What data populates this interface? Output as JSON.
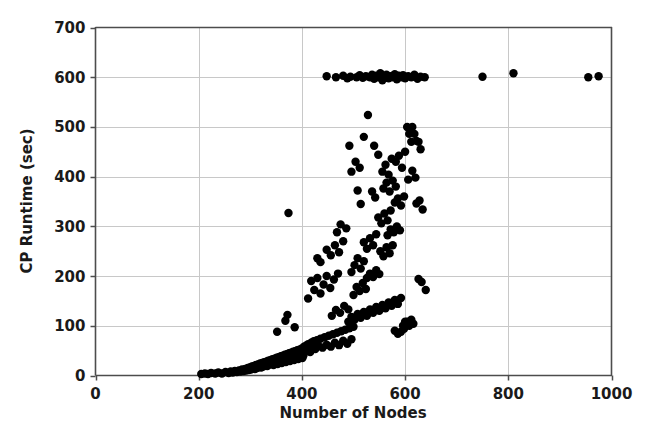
{
  "chart_data": {
    "type": "scatter",
    "title": "",
    "xlabel": "Number of Nodes",
    "ylabel": "CP Runtime (sec)",
    "xlim": [
      0,
      1000
    ],
    "ylim": [
      0,
      700
    ],
    "xticks": [
      0,
      200,
      400,
      600,
      800,
      1000
    ],
    "yticks": [
      0,
      100,
      200,
      300,
      400,
      500,
      600,
      700
    ],
    "xtick_labels": [
      "0",
      "200",
      "400",
      "600",
      "800",
      "1000"
    ],
    "ytick_labels": [
      "0",
      "100",
      "200",
      "300",
      "400",
      "500",
      "600",
      "700"
    ],
    "grid": true,
    "grid_color": "#c8c8c8",
    "marker_color": "#000000",
    "marker_size": 4.2,
    "legend": null,
    "points": [
      [
        205,
        3
      ],
      [
        212,
        4
      ],
      [
        218,
        3
      ],
      [
        224,
        5
      ],
      [
        232,
        4
      ],
      [
        238,
        6
      ],
      [
        245,
        4
      ],
      [
        252,
        7
      ],
      [
        258,
        5
      ],
      [
        262,
        8
      ],
      [
        266,
        6
      ],
      [
        270,
        9
      ],
      [
        274,
        7
      ],
      [
        278,
        10
      ],
      [
        281,
        8
      ],
      [
        284,
        12
      ],
      [
        287,
        9
      ],
      [
        290,
        13
      ],
      [
        292,
        10
      ],
      [
        295,
        15
      ],
      [
        297,
        11
      ],
      [
        299,
        16
      ],
      [
        301,
        12
      ],
      [
        303,
        18
      ],
      [
        305,
        14
      ],
      [
        307,
        19
      ],
      [
        309,
        13
      ],
      [
        311,
        21
      ],
      [
        313,
        15
      ],
      [
        315,
        22
      ],
      [
        317,
        17
      ],
      [
        319,
        24
      ],
      [
        321,
        16
      ],
      [
        323,
        25
      ],
      [
        325,
        18
      ],
      [
        327,
        27
      ],
      [
        329,
        20
      ],
      [
        331,
        28
      ],
      [
        333,
        19
      ],
      [
        335,
        30
      ],
      [
        337,
        22
      ],
      [
        339,
        31
      ],
      [
        341,
        24
      ],
      [
        343,
        33
      ],
      [
        345,
        21
      ],
      [
        347,
        34
      ],
      [
        349,
        26
      ],
      [
        351,
        36
      ],
      [
        353,
        23
      ],
      [
        355,
        37
      ],
      [
        357,
        28
      ],
      [
        359,
        39
      ],
      [
        361,
        25
      ],
      [
        363,
        40
      ],
      [
        365,
        30
      ],
      [
        367,
        42
      ],
      [
        369,
        27
      ],
      [
        371,
        43
      ],
      [
        373,
        32
      ],
      [
        375,
        45
      ],
      [
        377,
        29
      ],
      [
        379,
        46
      ],
      [
        381,
        34
      ],
      [
        383,
        48
      ],
      [
        385,
        31
      ],
      [
        387,
        49
      ],
      [
        389,
        36
      ],
      [
        391,
        51
      ],
      [
        393,
        33
      ],
      [
        395,
        52
      ],
      [
        397,
        38
      ],
      [
        399,
        54
      ],
      [
        401,
        35
      ],
      [
        403,
        40
      ],
      [
        405,
        56
      ],
      [
        352,
        88
      ],
      [
        368,
        110
      ],
      [
        374,
        327
      ],
      [
        372,
        122
      ],
      [
        386,
        97
      ],
      [
        396,
        46
      ],
      [
        398,
        42
      ],
      [
        400,
        50
      ],
      [
        402,
        44
      ],
      [
        404,
        58
      ],
      [
        406,
        49
      ],
      [
        408,
        60
      ],
      [
        410,
        52
      ],
      [
        412,
        63
      ],
      [
        414,
        55
      ],
      [
        416,
        47
      ],
      [
        418,
        66
      ],
      [
        420,
        57
      ],
      [
        423,
        69
      ],
      [
        426,
        53
      ],
      [
        429,
        71
      ],
      [
        432,
        60
      ],
      [
        436,
        74
      ],
      [
        440,
        56
      ],
      [
        444,
        77
      ],
      [
        448,
        62
      ],
      [
        452,
        80
      ],
      [
        456,
        58
      ],
      [
        460,
        83
      ],
      [
        464,
        66
      ],
      [
        468,
        86
      ],
      [
        472,
        61
      ],
      [
        476,
        89
      ],
      [
        480,
        70
      ],
      [
        484,
        92
      ],
      [
        488,
        64
      ],
      [
        492,
        95
      ],
      [
        496,
        73
      ],
      [
        500,
        98
      ],
      [
        412,
        155
      ],
      [
        418,
        190
      ],
      [
        424,
        172
      ],
      [
        430,
        196
      ],
      [
        436,
        165
      ],
      [
        442,
        183
      ],
      [
        448,
        200
      ],
      [
        455,
        176
      ],
      [
        462,
        193
      ],
      [
        470,
        205
      ],
      [
        448,
        253
      ],
      [
        456,
        242
      ],
      [
        464,
        262
      ],
      [
        472,
        248
      ],
      [
        480,
        270
      ],
      [
        458,
        120
      ],
      [
        466,
        132
      ],
      [
        474,
        126
      ],
      [
        482,
        140
      ],
      [
        490,
        133
      ],
      [
        430,
        236
      ],
      [
        436,
        228
      ],
      [
        475,
        304
      ],
      [
        468,
        288
      ],
      [
        486,
        296
      ],
      [
        496,
        208
      ],
      [
        502,
        222
      ],
      [
        508,
        236
      ],
      [
        514,
        215
      ],
      [
        520,
        230
      ],
      [
        500,
        162
      ],
      [
        506,
        178
      ],
      [
        512,
        170
      ],
      [
        518,
        186
      ],
      [
        524,
        174
      ],
      [
        490,
        108
      ],
      [
        496,
        118
      ],
      [
        502,
        112
      ],
      [
        508,
        124
      ],
      [
        514,
        116
      ],
      [
        520,
        128
      ],
      [
        526,
        120
      ],
      [
        532,
        133
      ],
      [
        538,
        126
      ],
      [
        544,
        138
      ],
      [
        550,
        130
      ],
      [
        556,
        142
      ],
      [
        562,
        135
      ],
      [
        568,
        147
      ],
      [
        574,
        140
      ],
      [
        580,
        152
      ],
      [
        586,
        144
      ],
      [
        592,
        156
      ],
      [
        596,
        100
      ],
      [
        600,
        108
      ],
      [
        520,
        268
      ],
      [
        526,
        255
      ],
      [
        532,
        276
      ],
      [
        538,
        262
      ],
      [
        544,
        284
      ],
      [
        526,
        196
      ],
      [
        532,
        205
      ],
      [
        538,
        198
      ],
      [
        544,
        212
      ],
      [
        550,
        204
      ],
      [
        548,
        318
      ],
      [
        554,
        306
      ],
      [
        560,
        326
      ],
      [
        566,
        312
      ],
      [
        572,
        332
      ],
      [
        552,
        250
      ],
      [
        558,
        240
      ],
      [
        564,
        258
      ],
      [
        570,
        246
      ],
      [
        576,
        262
      ],
      [
        558,
        376
      ],
      [
        564,
        388
      ],
      [
        570,
        370
      ],
      [
        576,
        392
      ],
      [
        582,
        380
      ],
      [
        566,
        282
      ],
      [
        572,
        294
      ],
      [
        578,
        288
      ],
      [
        584,
        300
      ],
      [
        590,
        292
      ],
      [
        536,
        370
      ],
      [
        542,
        358
      ],
      [
        508,
        372
      ],
      [
        514,
        345
      ],
      [
        496,
        410
      ],
      [
        504,
        430
      ],
      [
        512,
        418
      ],
      [
        492,
        462
      ],
      [
        520,
        480
      ],
      [
        528,
        524
      ],
      [
        540,
        462
      ],
      [
        548,
        444
      ],
      [
        556,
        410
      ],
      [
        562,
        424
      ],
      [
        568,
        404
      ],
      [
        574,
        436
      ],
      [
        580,
        348
      ],
      [
        586,
        356
      ],
      [
        592,
        342
      ],
      [
        598,
        360
      ],
      [
        582,
        430
      ],
      [
        588,
        442
      ],
      [
        594,
        418
      ],
      [
        600,
        450
      ],
      [
        604,
        500
      ],
      [
        608,
        486
      ],
      [
        612,
        470
      ],
      [
        606,
        394
      ],
      [
        614,
        412
      ],
      [
        620,
        398
      ],
      [
        626,
        470
      ],
      [
        630,
        455
      ],
      [
        622,
        346
      ],
      [
        628,
        352
      ],
      [
        634,
        334
      ],
      [
        614,
        500
      ],
      [
        618,
        486
      ],
      [
        622,
        472
      ],
      [
        626,
        194
      ],
      [
        632,
        188
      ],
      [
        640,
        172
      ],
      [
        604,
        108
      ],
      [
        608,
        100
      ],
      [
        612,
        112
      ],
      [
        616,
        104
      ],
      [
        592,
        88
      ],
      [
        598,
        94
      ],
      [
        586,
        84
      ],
      [
        580,
        90
      ],
      [
        466,
        600
      ],
      [
        480,
        603
      ],
      [
        488,
        598
      ],
      [
        494,
        601
      ],
      [
        506,
        600
      ],
      [
        512,
        604
      ],
      [
        518,
        599
      ],
      [
        524,
        602
      ],
      [
        532,
        600
      ],
      [
        536,
        605
      ],
      [
        540,
        597
      ],
      [
        544,
        603
      ],
      [
        548,
        600
      ],
      [
        552,
        608
      ],
      [
        556,
        594
      ],
      [
        560,
        601
      ],
      [
        564,
        605
      ],
      [
        568,
        598
      ],
      [
        572,
        602
      ],
      [
        576,
        600
      ],
      [
        580,
        606
      ],
      [
        584,
        596
      ],
      [
        588,
        603
      ],
      [
        592,
        600
      ],
      [
        596,
        604
      ],
      [
        600,
        598
      ],
      [
        606,
        602
      ],
      [
        612,
        600
      ],
      [
        618,
        605
      ],
      [
        624,
        597
      ],
      [
        630,
        601
      ],
      [
        638,
        600
      ],
      [
        448,
        602
      ],
      [
        750,
        601
      ],
      [
        810,
        608
      ],
      [
        955,
        600
      ],
      [
        975,
        602
      ]
    ]
  }
}
